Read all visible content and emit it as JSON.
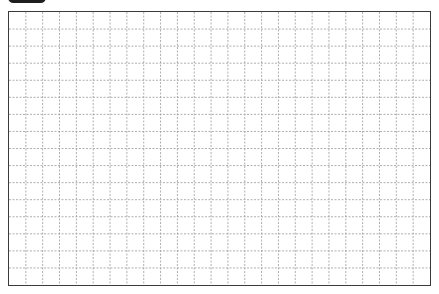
{
  "tab": {
    "color": "#1e1e1e"
  },
  "grid": {
    "columns": 25,
    "rows": 16,
    "border_color": "#3a3a3a",
    "line_color": "#9a9a9a",
    "line_style": "dashed",
    "background": "#ffffff"
  }
}
